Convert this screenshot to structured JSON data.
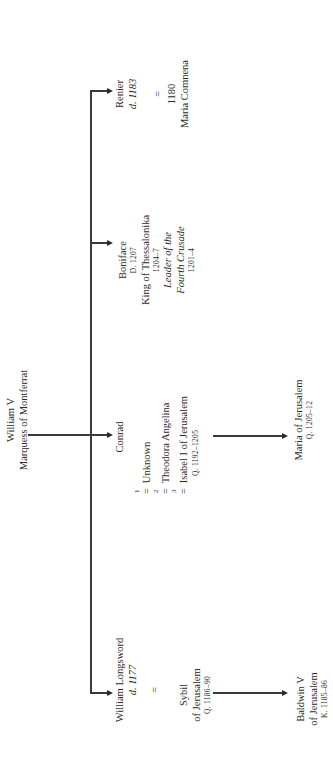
{
  "root": {
    "name": "William V",
    "title": "Marquess of Montferrat"
  },
  "children": [
    {
      "name": "Renier",
      "dates": "d. 1183",
      "marriage_symbol": "=",
      "marriage_year": "1180",
      "spouse": "Maria Comnena"
    },
    {
      "name": "Boniface",
      "dates": "D. 1207",
      "title": "King of Thessalonika",
      "title_years": "1204–7",
      "role_line1": "Leader of the",
      "role_line2": "Fourth Crusade",
      "role_years": "1201–4"
    },
    {
      "name": "Conrad",
      "marriages": [
        {
          "number": "1",
          "symbol": "=",
          "spouse": "Unknown",
          "spouse_dates": ""
        },
        {
          "number": "2",
          "symbol": "=",
          "spouse": "Theodora Angelina",
          "spouse_dates": ""
        },
        {
          "number": "3",
          "symbol": "=",
          "spouse": "Isabel I of Jerusalem",
          "spouse_dates": "Q. 1192–1205"
        }
      ],
      "child": {
        "name": "Maria of Jerusalem",
        "dates": "Q. 1205–12"
      }
    },
    {
      "name": "William Longsword",
      "dates": "d. 1177",
      "marriage_symbol": "=",
      "spouse_line1": "Sybil",
      "spouse_line2": "of Jerusalem",
      "spouse_dates": "Q. 1186–90",
      "child": {
        "name_line1": "Baldwin V",
        "name_line2": "of Jerusalem",
        "dates": "K. 1185–86"
      }
    }
  ]
}
